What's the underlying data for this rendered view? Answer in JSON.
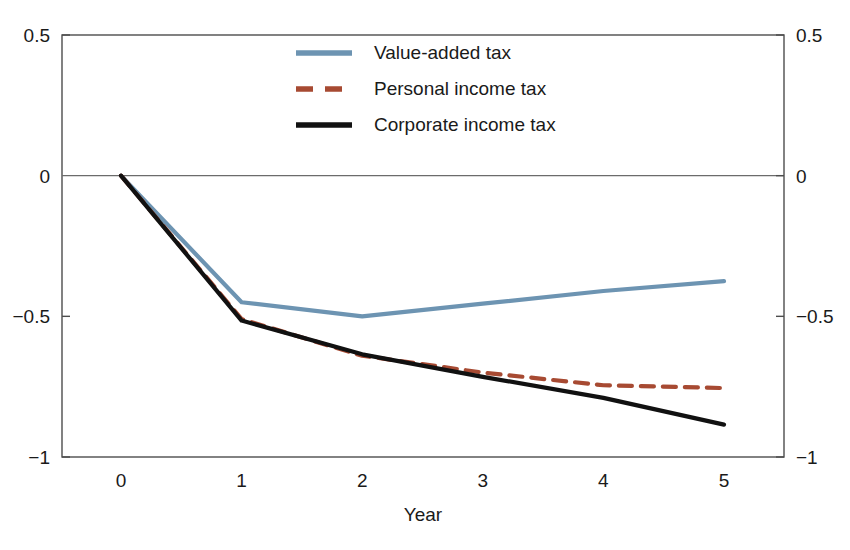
{
  "chart_data": {
    "type": "line",
    "title": "",
    "subtitle": "",
    "xlabel": "Year",
    "ylabel": "",
    "x": [
      0,
      1,
      2,
      3,
      4,
      5
    ],
    "categories": [
      "0",
      "1",
      "2",
      "3",
      "4",
      "5"
    ],
    "xlim": [
      -0.5,
      5.5
    ],
    "ylim": [
      -1,
      0.5
    ],
    "grid": false,
    "legend_position": "top-center",
    "zero_reference_line": 0,
    "dual_y_axis": true,
    "series": [
      {
        "name": "Value-added tax",
        "color": "#6d94b2",
        "style": "solid",
        "width": 4.2,
        "values": [
          0,
          -0.45,
          -0.5,
          -0.455,
          -0.41,
          -0.375
        ]
      },
      {
        "name": "Personal income tax",
        "color": "#a74a32",
        "style": "dashed",
        "width": 4.2,
        "values": [
          0,
          -0.51,
          -0.64,
          -0.7,
          -0.745,
          -0.755
        ]
      },
      {
        "name": "Corporate income tax",
        "color": "#111111",
        "style": "solid",
        "width": 4.2,
        "values": [
          0,
          -0.515,
          -0.635,
          -0.715,
          -0.79,
          -0.885
        ]
      }
    ],
    "y_ticks": [
      {
        "value": 0.5,
        "label": "0.5"
      },
      {
        "value": 0,
        "label": "0"
      },
      {
        "value": -0.5,
        "label": "−0.5"
      },
      {
        "value": -1,
        "label": "−1"
      }
    ],
    "x_ticks": [
      {
        "value": 0,
        "label": "0"
      },
      {
        "value": 1,
        "label": "1"
      },
      {
        "value": 2,
        "label": "2"
      },
      {
        "value": 3,
        "label": "3"
      },
      {
        "value": 4,
        "label": "4"
      },
      {
        "value": 5,
        "label": "5"
      }
    ]
  },
  "axes": {
    "x_title": "Year",
    "left_tick_labels": [
      "0.5",
      "0",
      "−0.5",
      "−1"
    ],
    "right_tick_labels": [
      "0.5",
      "0",
      "−0.5",
      "−1"
    ],
    "x_tick_labels": [
      "0",
      "1",
      "2",
      "3",
      "4",
      "5"
    ]
  },
  "legend": {
    "entries": [
      {
        "label": "Value-added tax",
        "color": "#6d94b2",
        "style": "solid"
      },
      {
        "label": "Personal income tax",
        "color": "#a74a32",
        "style": "dashed"
      },
      {
        "label": "Corporate income tax",
        "color": "#111111",
        "style": "solid"
      }
    ]
  },
  "colors": {
    "value_added_tax": "#6d94b2",
    "personal_income_tax": "#a74a32",
    "corporate_income_tax": "#111111",
    "axis": "#4d4d4d",
    "zero_line": "#6b6b6b",
    "background": "#ffffff",
    "text": "#1a1a1a"
  }
}
